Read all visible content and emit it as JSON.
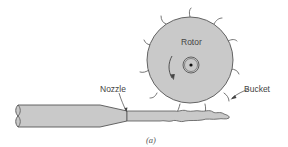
{
  "figure": {
    "caption": "(a)",
    "labels": {
      "rotor": "Rotor",
      "nozzle": "Nozzle",
      "bucket": "Bucket"
    },
    "colors": {
      "fill": "#c9c9c9",
      "stroke": "#555555",
      "background": "#ffffff",
      "text": "#444444"
    }
  }
}
